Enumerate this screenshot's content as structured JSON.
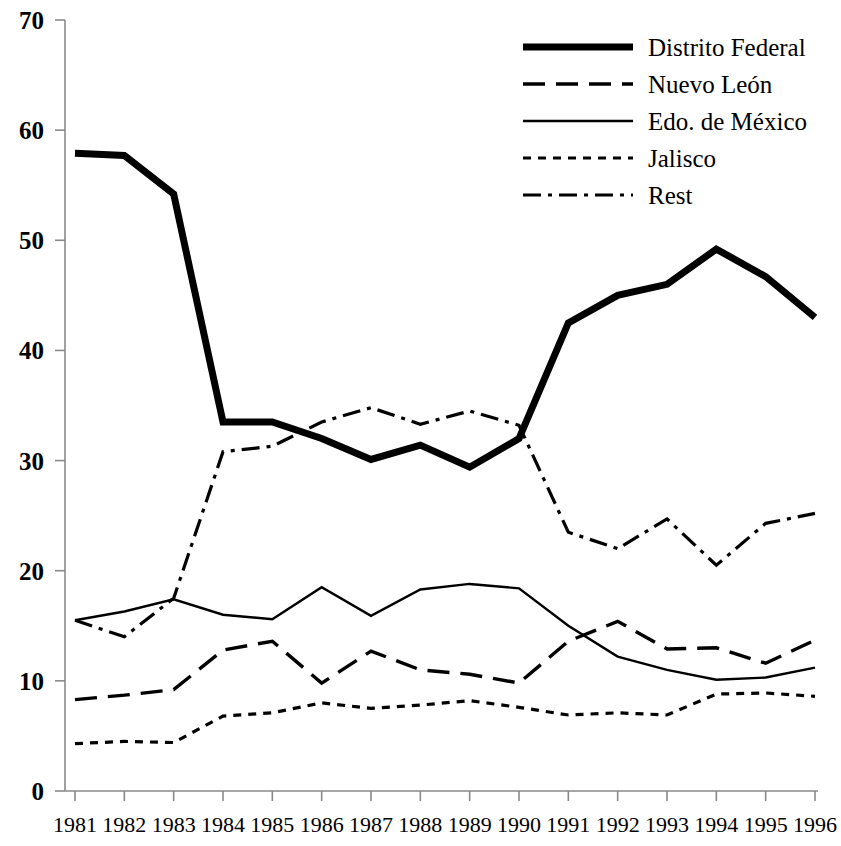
{
  "chart_data": {
    "type": "line",
    "title": "",
    "xlabel": "",
    "ylabel": "",
    "xlim": [
      1981,
      1996
    ],
    "ylim": [
      0,
      70
    ],
    "grid": false,
    "legend_position": "top-right",
    "x": [
      1981,
      1982,
      1983,
      1984,
      1985,
      1986,
      1987,
      1988,
      1989,
      1990,
      1991,
      1992,
      1993,
      1994,
      1995,
      1996
    ],
    "categories": [
      "1981",
      "1982",
      "1983",
      "1984",
      "1985",
      "1986",
      "1987",
      "1988",
      "1989",
      "1990",
      "1991",
      "1992",
      "1993",
      "1994",
      "1995",
      "1996"
    ],
    "ytick_labels": [
      "0",
      "10",
      "20",
      "30",
      "40",
      "50",
      "60",
      "70"
    ],
    "yticks": [
      0,
      10,
      20,
      30,
      40,
      50,
      60,
      70
    ],
    "series": [
      {
        "name": "Distrito Federal",
        "style": "solid-thick",
        "stroke_width": 7.0,
        "dash": "none",
        "values": [
          57.9,
          57.7,
          54.2,
          33.5,
          33.5,
          32.0,
          30.1,
          31.4,
          29.4,
          32.0,
          42.5,
          45.0,
          46.0,
          49.2,
          46.7,
          43.0
        ]
      },
      {
        "name": "Nuevo León",
        "style": "dashed",
        "stroke_width": 3.4,
        "dash": "22,11",
        "values": [
          8.3,
          8.7,
          9.2,
          12.8,
          13.6,
          9.8,
          12.7,
          11.0,
          10.6,
          9.8,
          13.6,
          15.4,
          12.9,
          13.0,
          11.6,
          13.7
        ]
      },
      {
        "name": "Edo. de México",
        "style": "solid-thin",
        "stroke_width": 2.4,
        "dash": "none",
        "values": [
          15.5,
          16.3,
          17.4,
          16.0,
          15.6,
          18.5,
          15.9,
          18.3,
          18.8,
          18.4,
          15.0,
          12.2,
          11.0,
          10.1,
          10.3,
          11.2
        ]
      },
      {
        "name": "Jalisco",
        "style": "dotted",
        "stroke_width": 3.2,
        "dash": "8,7",
        "values": [
          4.3,
          4.5,
          4.4,
          6.8,
          7.1,
          8.0,
          7.5,
          7.8,
          8.2,
          7.6,
          6.9,
          7.1,
          6.9,
          8.8,
          8.9,
          8.6
        ]
      },
      {
        "name": "Rest",
        "style": "dash-dot",
        "stroke_width": 3.2,
        "dash": "18,7,4,7",
        "values": [
          15.5,
          14.0,
          17.5,
          30.8,
          31.3,
          33.5,
          34.8,
          33.3,
          34.5,
          33.2,
          23.5,
          22.0,
          24.7,
          20.5,
          24.3,
          25.2
        ]
      }
    ]
  },
  "legend": {
    "items": [
      {
        "label": "Distrito Federal",
        "series_index": 0
      },
      {
        "label": "Nuevo León",
        "series_index": 1
      },
      {
        "label": "Edo. de México",
        "series_index": 2
      },
      {
        "label": "Jalisco",
        "series_index": 3
      },
      {
        "label": "Rest",
        "series_index": 4
      }
    ]
  },
  "colors": {
    "ink": "#000000",
    "axis": "#8a8a8a",
    "background": "#ffffff"
  }
}
